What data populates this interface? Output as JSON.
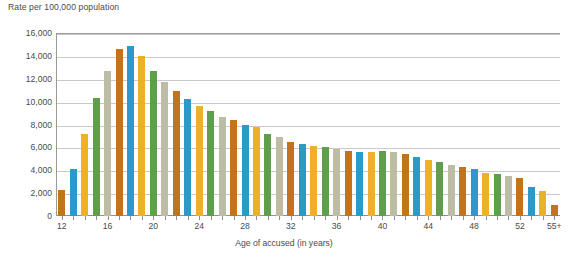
{
  "chart_data": {
    "type": "bar",
    "title": "",
    "ylabel": "Rate per 100,000 population",
    "xlabel": "Age of accused (in years)",
    "ylim": [
      0,
      16000
    ],
    "ytick_values": [
      0,
      2000,
      4000,
      6000,
      8000,
      10000,
      12000,
      14000,
      16000
    ],
    "ytick_labels": [
      "0",
      "2,000",
      "4,000",
      "6,000",
      "8,000",
      "10,000",
      "12,000",
      "14,000",
      "16,000"
    ],
    "grid": true,
    "legend": "none",
    "xtick_labels": [
      "12",
      "16",
      "20",
      "24",
      "28",
      "32",
      "36",
      "40",
      "44",
      "48",
      "52",
      "55+"
    ],
    "xtick_categories": [
      "12",
      "16",
      "20",
      "24",
      "28",
      "32",
      "36",
      "40",
      "44",
      "48",
      "52",
      "55+"
    ],
    "categories": [
      "12",
      "13",
      "14",
      "15",
      "16",
      "17",
      "18",
      "19",
      "20",
      "21",
      "22",
      "23",
      "24",
      "25",
      "26",
      "27",
      "28",
      "29",
      "30",
      "31",
      "32",
      "33",
      "34",
      "35",
      "36",
      "37",
      "38",
      "39",
      "40",
      "41",
      "42",
      "43",
      "44",
      "45",
      "46",
      "47",
      "48",
      "49",
      "50",
      "51",
      "52",
      "53",
      "54",
      "55+"
    ],
    "values": [
      2300,
      4100,
      7200,
      10300,
      12700,
      14600,
      14900,
      14000,
      12700,
      11700,
      10900,
      10200,
      9600,
      9200,
      8700,
      8400,
      8000,
      7800,
      7200,
      6900,
      6500,
      6300,
      6100,
      6000,
      5900,
      5700,
      5600,
      5600,
      5700,
      5600,
      5400,
      5200,
      4900,
      4700,
      4500,
      4300,
      4100,
      3800,
      3700,
      3500,
      3300,
      2500,
      2200,
      1000
    ],
    "palette": [
      "#c1741c",
      "#2b9ac9",
      "#eeb02b",
      "#5f9e4b",
      "#bdbca5"
    ],
    "palette_names": [
      "orange",
      "blue",
      "gold",
      "green",
      "beige"
    ],
    "bar_colors": [
      "#c1741c",
      "#2b9ac9",
      "#eeb02b",
      "#5f9e4b",
      "#bdbca5",
      "#c1741c",
      "#2b9ac9",
      "#eeb02b",
      "#5f9e4b",
      "#bdbca5",
      "#c1741c",
      "#2b9ac9",
      "#eeb02b",
      "#5f9e4b",
      "#bdbca5",
      "#c1741c",
      "#2b9ac9",
      "#eeb02b",
      "#5f9e4b",
      "#bdbca5",
      "#c1741c",
      "#2b9ac9",
      "#eeb02b",
      "#5f9e4b",
      "#bdbca5",
      "#c1741c",
      "#2b9ac9",
      "#eeb02b",
      "#5f9e4b",
      "#bdbca5",
      "#c1741c",
      "#2b9ac9",
      "#eeb02b",
      "#5f9e4b",
      "#bdbca5",
      "#c1741c",
      "#2b9ac9",
      "#eeb02b",
      "#5f9e4b",
      "#bdbca5",
      "#c1741c",
      "#2b9ac9",
      "#eeb02b",
      "#c1741c"
    ],
    "axis_color": "#8f8f8f",
    "grid_color": "#c9c9c9",
    "text_color": "#4a4a4a",
    "background": "#ffffff"
  }
}
